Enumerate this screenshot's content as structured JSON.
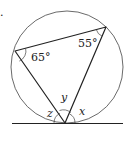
{
  "diagram": {
    "type": "circle-geometry",
    "marker": ".",
    "circle": {
      "cx": 67,
      "cy": 67,
      "r": 56
    },
    "tangent_line": {
      "x1": 12,
      "y1": 123.5,
      "x2": 123,
      "y2": 123.5
    },
    "vertices": {
      "left": {
        "x": 15,
        "y": 51
      },
      "right": {
        "x": 106,
        "y": 27
      },
      "bottom": {
        "x": 65,
        "y": 123
      }
    },
    "angle_labels": [
      {
        "id": "angle-left",
        "text": "65°",
        "x": 31,
        "y": 61
      },
      {
        "id": "angle-right",
        "text": "55°",
        "x": 78,
        "y": 47
      }
    ],
    "variable_labels": [
      {
        "id": "var-y",
        "text": "y",
        "x": 61,
        "y": 101
      },
      {
        "id": "var-z",
        "text": "z",
        "x": 47,
        "y": 117
      },
      {
        "id": "var-x",
        "text": "x",
        "x": 79,
        "y": 115
      }
    ],
    "stroke_color": "#333333"
  }
}
